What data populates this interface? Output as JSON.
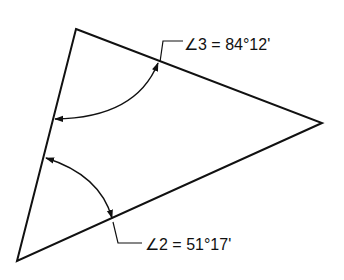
{
  "diagram": {
    "type": "triangle-angle-measurement",
    "stroke_color": "#111111",
    "background": "#ffffff",
    "vertices": {
      "top": [
        76,
        29
      ],
      "right": [
        322,
        123
      ],
      "bottom": [
        17,
        261
      ]
    },
    "angles": [
      {
        "id": "angle-3",
        "vertex": "top",
        "label": "∠3 = 84°12'",
        "symbol": "∠",
        "number": "3",
        "degrees": 84,
        "minutes": 12
      },
      {
        "id": "angle-2",
        "vertex": "bottom",
        "label": "∠2 = 51°17'",
        "symbol": "∠",
        "number": "2",
        "degrees": 51,
        "minutes": 17
      }
    ]
  }
}
